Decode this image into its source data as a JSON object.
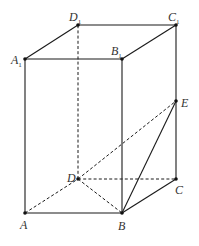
{
  "diagram": {
    "type": "geometry",
    "colors": {
      "line": "#1a1a1a",
      "label": "#333333",
      "background": "#ffffff"
    },
    "vertices": {
      "A": {
        "label": "A",
        "sub": "",
        "x": 25,
        "y": 213
      },
      "B": {
        "label": "B",
        "sub": "",
        "x": 122,
        "y": 213
      },
      "C": {
        "label": "C",
        "sub": "",
        "x": 176,
        "y": 179
      },
      "D": {
        "label": "D",
        "sub": "",
        "x": 78,
        "y": 179
      },
      "A1": {
        "label": "A",
        "sub": "1",
        "x": 25,
        "y": 59
      },
      "B1": {
        "label": "B",
        "sub": "1",
        "x": 122,
        "y": 59
      },
      "C1": {
        "label": "C",
        "sub": "1",
        "x": 176,
        "y": 25
      },
      "D1": {
        "label": "D",
        "sub": "1",
        "x": 78,
        "y": 25
      },
      "E": {
        "label": "E",
        "sub": "",
        "x": 176,
        "y": 101
      }
    },
    "solid_edges": [
      "A-B",
      "B-C",
      "A-A1",
      "B-B1",
      "C-C1",
      "A1-B1",
      "B1-C1",
      "C1-D1",
      "D1-A1",
      "B-E"
    ],
    "dashed_edges": [
      "A-D",
      "D-C",
      "D-D1",
      "D-B",
      "D-E"
    ]
  }
}
